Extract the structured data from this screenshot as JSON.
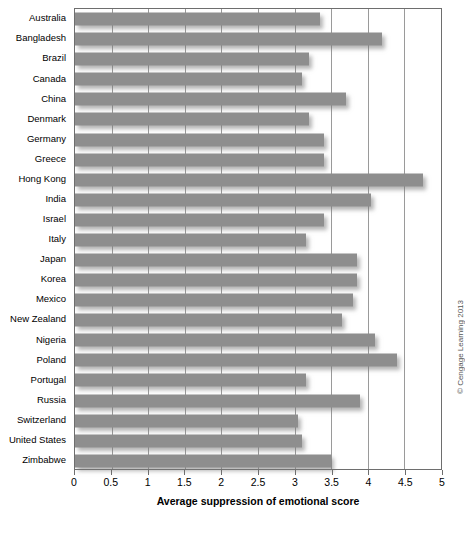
{
  "chart_data": {
    "type": "bar",
    "orientation": "horizontal",
    "title": "",
    "xlabel": "Average suppression of emotional score",
    "ylabel": "",
    "xlim": [
      0,
      5
    ],
    "xticks": [
      0,
      0.5,
      1,
      1.5,
      2,
      2.5,
      3,
      3.5,
      4,
      4.5,
      5
    ],
    "xticklabels": [
      "0",
      "0.5",
      "1",
      "1.5",
      "2",
      "2.5",
      "3",
      "3.5",
      "4",
      "4.5",
      "5"
    ],
    "grid": "vertical",
    "legend": null,
    "bar_color": "#8e8e8e",
    "categories": [
      "Australia",
      "Bangladesh",
      "Brazil",
      "Canada",
      "China",
      "Denmark",
      "Germany",
      "Greece",
      "Hong Kong",
      "India",
      "Israel",
      "Italy",
      "Japan",
      "Korea",
      "Mexico",
      "New Zealand",
      "Nigeria",
      "Poland",
      "Portugal",
      "Russia",
      "Switzerland",
      "United States",
      "Zimbabwe"
    ],
    "values": [
      3.35,
      4.2,
      3.2,
      3.1,
      3.7,
      3.2,
      3.4,
      3.4,
      4.75,
      4.05,
      3.4,
      3.15,
      3.85,
      3.85,
      3.8,
      3.65,
      4.1,
      4.4,
      3.15,
      3.9,
      3.05,
      3.1,
      3.5
    ]
  },
  "credit": {
    "text": "© Cengage Learning 2013"
  }
}
